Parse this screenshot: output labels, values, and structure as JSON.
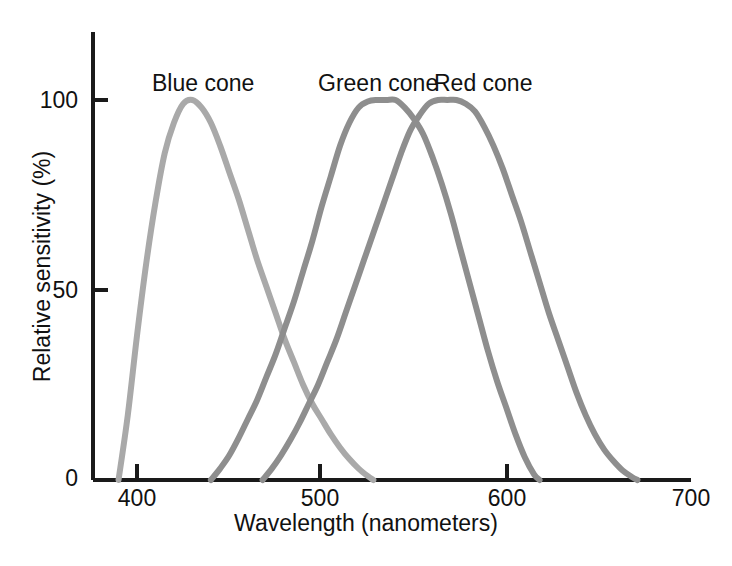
{
  "chart_data": {
    "type": "line",
    "title": "",
    "xlabel": "Wavelength (nanometers)",
    "ylabel": "Relative sensitivity (%)",
    "xlim": [
      380,
      700
    ],
    "ylim": [
      0,
      105
    ],
    "grid": false,
    "legend_position": "inline-annotations",
    "xticks": [
      400,
      500,
      600,
      700
    ],
    "xtick_labels": [
      "400",
      "500",
      "600",
      "700"
    ],
    "yticks": [
      0,
      50,
      100
    ],
    "ytick_labels": [
      "0",
      "50",
      "100"
    ],
    "series": [
      {
        "name": "Blue cone",
        "color": "#a9a9a9",
        "peak_x": 430,
        "peak_y": 100,
        "x": [
          390,
          395,
          400,
          405,
          410,
          415,
          420,
          425,
          430,
          435,
          440,
          445,
          450,
          455,
          460,
          465,
          470,
          475,
          480,
          485,
          490,
          495,
          500,
          505,
          510,
          515,
          520,
          525,
          528
        ],
        "values": [
          0,
          17,
          38,
          57,
          73,
          86,
          94,
          99,
          100,
          98,
          94,
          88,
          81,
          74,
          66,
          58,
          51,
          44,
          37,
          31,
          25,
          20,
          16,
          12,
          8.5,
          5.5,
          3,
          1,
          0
        ]
      },
      {
        "name": "Green cone",
        "color": "#8e8e8e",
        "peak_x": 540,
        "peak_y": 100,
        "x": [
          440,
          445,
          450,
          455,
          460,
          465,
          470,
          475,
          480,
          485,
          490,
          495,
          500,
          505,
          510,
          515,
          520,
          525,
          530,
          535,
          540,
          545,
          550,
          555,
          560,
          565,
          570,
          575,
          580,
          585,
          590,
          595,
          600,
          605,
          610,
          615,
          618
        ],
        "values": [
          0,
          3,
          6.5,
          11,
          16,
          21,
          27,
          33,
          40,
          47,
          55,
          63,
          72,
          80,
          88,
          94,
          98,
          99.6,
          100,
          100,
          100,
          98,
          95,
          91,
          85,
          78,
          70,
          61,
          52,
          43,
          34,
          26,
          19,
          12,
          6,
          1.5,
          0
        ]
      },
      {
        "name": "Red cone",
        "color": "#8e8e8e",
        "peak_x": 573,
        "peak_y": 100,
        "x": [
          468,
          473,
          478,
          483,
          488,
          493,
          498,
          503,
          508,
          513,
          518,
          523,
          528,
          533,
          538,
          543,
          548,
          553,
          558,
          563,
          568,
          573,
          578,
          583,
          588,
          593,
          598,
          603,
          608,
          613,
          618,
          623,
          628,
          633,
          638,
          643,
          648,
          653,
          658,
          663,
          668,
          671
        ],
        "values": [
          0,
          3,
          6.5,
          10.5,
          15,
          20,
          25,
          31,
          37,
          44,
          51,
          58,
          65,
          72,
          79,
          86,
          92,
          96,
          99,
          100,
          100,
          100,
          99,
          97,
          93,
          88,
          82,
          75,
          68,
          60,
          52,
          44,
          37,
          30,
          23,
          17,
          12,
          8,
          5,
          2.5,
          0.8,
          0
        ]
      }
    ],
    "annotations": [
      {
        "text": "Blue cone",
        "x": 430,
        "y": 110
      },
      {
        "text": "Green cone",
        "x": 528,
        "y": 110
      },
      {
        "text": "Red cone",
        "x": 597,
        "y": 110
      }
    ]
  },
  "axes": {
    "x_title": "Wavelength (nanometers)",
    "y_title": "Relative sensitivity (%)",
    "x_ticks": [
      {
        "label": "400"
      },
      {
        "label": "500"
      },
      {
        "label": "600"
      },
      {
        "label": "700"
      }
    ],
    "y_ticks": [
      {
        "label": "100"
      },
      {
        "label": "50"
      },
      {
        "label": "0"
      }
    ]
  },
  "labels": {
    "blue_cone": "Blue cone",
    "green_cone": "Green cone",
    "red_cone": "Red cone"
  },
  "colors": {
    "axis": "#1a1a1a",
    "blue_cone_curve": "#a9a9a9",
    "green_cone_curve": "#8e8e8e",
    "red_cone_curve": "#8e8e8e",
    "background": "#ffffff",
    "text": "#111111"
  }
}
